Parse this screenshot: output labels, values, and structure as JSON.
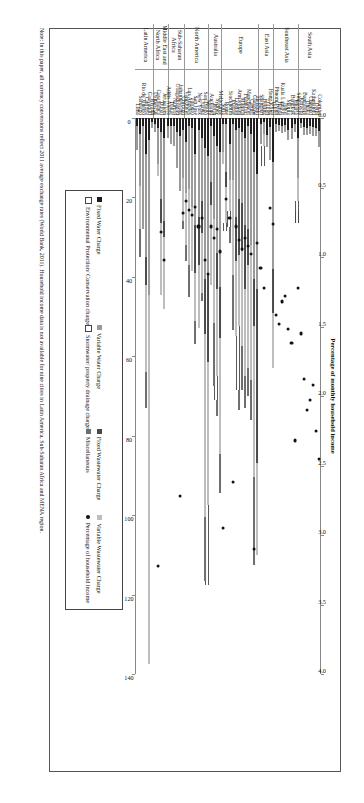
{
  "figure": {
    "note": "Note: In this paper, all currency conversions reflect 2011 average exchange rates (World Bank, 2011). Household income data is not available for nine cities in Latin America, Sub-Saharan Africa and MENA region."
  },
  "legend": {
    "columns": [
      [
        {
          "key": "fixed-water-charge",
          "label": "Fixed Water Charge",
          "swatch": "k-fixwater"
        },
        {
          "key": "epcc",
          "label": "Environmental Protection/ Conservation charge",
          "swatch": "k-epcc"
        }
      ],
      [
        {
          "key": "variable-water-charge",
          "label": "Variable Water Charge",
          "swatch": "k-varwater"
        },
        {
          "key": "stormwater-drainage",
          "label": "Stormwater/ property drainage charge",
          "swatch": "k-storm"
        }
      ],
      [
        {
          "key": "fixed-wastewater-charge",
          "label": "Fixed Wastewater Charge",
          "swatch": "k-fixwaste"
        },
        {
          "key": "miscellaneous",
          "label": "Miscellaneous",
          "swatch": "k-misc"
        }
      ],
      [
        {
          "key": "variable-wastewater-charge",
          "label": "Variable Wastewater Charge",
          "swatch": "k-varwaste"
        },
        {
          "key": "percentage-household-income",
          "label": "Percentage of household income",
          "swatch": "k-dot"
        }
      ]
    ]
  },
  "chart_data": {
    "type": "bar",
    "orientation": "horizontal-stacked",
    "title": "",
    "xlabel": "Domestic water and wastewater bill (USD per month)",
    "xlabel_secondary": "Percentage of monthly household income",
    "ylabel": "",
    "xlim": [
      0,
      140
    ],
    "xticks": [
      0,
      20,
      40,
      60,
      80,
      100,
      120,
      140
    ],
    "xlim_secondary": [
      0.0,
      4.0
    ],
    "xticks_secondary": [
      "0.0",
      "0.5",
      "1.0",
      "1.5",
      "2.0",
      "2.5",
      "3.0",
      "3.5",
      "4.0"
    ],
    "grid": false,
    "legend_position": "bottom",
    "stack_order": [
      "Fixed Water Charge",
      "Variable Water Charge",
      "Fixed Wastewater Charge",
      "Variable Wastewater Charge",
      "Stormwater/ property drainage charge",
      "Environmental Protection/ Conservation charge",
      "Miscellaneous"
    ],
    "regions": [
      {
        "name": "South Asia",
        "lines": [
          "South Asia"
        ],
        "count": 7
      },
      {
        "name": "Southeast Asia",
        "lines": [
          "Southeast Asia"
        ],
        "count": 8
      },
      {
        "name": "East Asia",
        "lines": [
          "East Asia"
        ],
        "count": 5
      },
      {
        "name": "Europe",
        "lines": [
          "Europe"
        ],
        "count": 12
      },
      {
        "name": "Australia",
        "lines": [
          "Australia"
        ],
        "count": 4
      },
      {
        "name": "North America",
        "lines": [
          "North America"
        ],
        "count": 8
      },
      {
        "name": "Sub-Saharan Africa",
        "lines": [
          "Sub-Saharan",
          "Africa"
        ],
        "count": 5
      },
      {
        "name": "Middle East and North Africa",
        "lines": [
          "Middle East and",
          "North Africa"
        ],
        "count": 5
      },
      {
        "name": "Latin America",
        "lines": [
          "Latin America"
        ],
        "count": 5
      }
    ],
    "categories": [
      "Colombo",
      "Delhi",
      "Kathmandu",
      "Chennai",
      "Dhaka",
      "Bangalore",
      "Karachi",
      "Singapore",
      "Jakarta",
      "Bangkok",
      "Manila",
      "Johor",
      "Kuala Lumpur",
      "Hanoi",
      "Phnom Penh",
      "Tokyo",
      "Hong Kong",
      "Taipei",
      "Beijing",
      "Shanghai",
      "Helsinki",
      "Glasgow",
      "Cardiff",
      "Manchester",
      "Frankfurt",
      "Munich",
      "Amsterdam",
      "London",
      "Prague",
      "Stockholm",
      "Rome",
      "Sofia",
      "Melbourne",
      "Sydney",
      "Perth",
      "Auckland",
      "Seattle",
      "San Diego",
      "Ottawa",
      "New York",
      "San Jose",
      "Toronto",
      "Los Angeles",
      "Vancouver",
      "Chicago",
      "Johannesburg",
      "Ouagadougou",
      "Nairobi",
      "Dakar",
      "Addis Ababa",
      "Jerusalem",
      "Dubai",
      "Casablanca",
      "Damascus",
      "Riyadh",
      "Guayaquil",
      "Curitiba",
      "Rio de Janeiro",
      "Santiago",
      "Lima"
    ],
    "series": [
      {
        "name": "Fixed Water Charge",
        "class": "s-fixwater",
        "values": [
          3.2,
          2.6,
          2.2,
          2.1,
          2.4,
          2.3,
          1.2,
          5.0,
          1.6,
          2.4,
          3.1,
          1.7,
          1.9,
          1.8,
          1.6,
          11.0,
          2.2,
          4.4,
          1.0,
          1.5,
          14.0,
          8.5,
          4.0,
          2.0,
          5.0,
          3.5,
          2.5,
          3.0,
          1.5,
          6.5,
          1.5,
          1.5,
          8.5,
          7.0,
          4.5,
          2.0,
          9.5,
          7.5,
          5.0,
          3.0,
          9.0,
          2.5,
          2.0,
          6.0,
          3.0,
          4.5,
          3.5,
          2.0,
          2.0,
          2.0,
          5.0,
          3.5,
          2.5,
          1.5,
          1.0,
          5.5,
          9.0,
          2.0,
          4.0,
          2.0
        ]
      },
      {
        "name": "Variable Water Charge",
        "class": "s-varwater",
        "values": [
          4.0,
          2.0,
          2.4,
          2.0,
          1.8,
          2.0,
          1.2,
          10.0,
          2.0,
          3.0,
          2.5,
          1.8,
          2.0,
          1.6,
          2.0,
          27.0,
          8.5,
          3.0,
          3.0,
          5.0,
          29.0,
          32.0,
          28.0,
          26.0,
          22.0,
          18.0,
          18.0,
          22.0,
          14.0,
          9.0,
          12.0,
          7.0,
          34.0,
          27.0,
          21.0,
          14.0,
          30.0,
          33.0,
          16.0,
          22.0,
          18.0,
          20.0,
          16.0,
          13.0,
          12.0,
          14.0,
          9.0,
          5.0,
          4.5,
          3.0,
          21.0,
          17.0,
          9.0,
          2.0,
          1.5,
          39.0,
          26.0,
          26.0,
          13.0,
          6.0
        ]
      },
      {
        "name": "Fixed Wastewater Charge",
        "class": "s-fixwaste",
        "values": [
          0,
          0,
          0,
          0,
          0,
          0,
          0,
          0,
          0,
          0,
          0,
          0,
          0,
          0,
          0,
          11.0,
          0,
          0,
          0,
          0,
          44.0,
          12.0,
          0,
          9.0,
          16.0,
          12.0,
          14.0,
          11.0,
          0,
          0,
          4.0,
          0,
          13.0,
          9.0,
          0,
          6.0,
          22.0,
          14.0,
          8.0,
          12.0,
          12.0,
          0,
          0,
          0,
          0,
          0,
          0,
          0,
          0,
          0,
          4.0,
          6.0,
          0,
          0,
          0,
          0,
          7.0,
          0,
          0,
          0
        ]
      },
      {
        "name": "Variable Wastewater Charge",
        "class": "s-varwaste",
        "values": [
          0,
          0,
          0,
          0,
          0,
          0,
          0,
          6.0,
          0,
          0,
          0,
          0,
          0,
          0,
          0,
          14.0,
          0,
          0,
          3.0,
          0,
          23.0,
          38.0,
          34.0,
          26.0,
          22.0,
          24.0,
          18.0,
          19.0,
          24.0,
          8.0,
          9.0,
          3.0,
          29.0,
          22.0,
          26.0,
          20.0,
          36.0,
          46.0,
          15.0,
          16.0,
          12.0,
          16.0,
          19.0,
          13.0,
          11.0,
          0,
          0,
          0,
          0,
          0,
          18.0,
          18.0,
          3.0,
          0,
          0,
          93.0,
          22.0,
          0,
          11.0,
          0
        ]
      },
      {
        "name": "Stormwater/ property drainage charge",
        "class": "s-storm",
        "values": [
          0,
          0,
          0,
          0,
          0,
          0,
          0,
          2.5,
          0,
          0,
          0,
          0,
          0,
          0,
          0,
          0,
          0,
          0,
          5.0,
          0,
          0,
          0,
          0,
          0,
          0,
          0,
          16.0,
          0,
          0,
          4.0,
          2.0,
          0,
          0,
          6.0,
          0,
          0,
          20.0,
          0,
          0,
          0,
          0,
          0,
          0,
          0,
          0,
          0,
          0,
          0,
          0,
          0,
          0,
          0,
          0,
          0,
          0,
          0,
          0,
          0,
          0,
          0
        ]
      },
      {
        "name": "Environmental Protection/ Conservation charge",
        "class": "s-epcc",
        "values": [
          0,
          0,
          0,
          0,
          0,
          0,
          0,
          3.0,
          0,
          0,
          0,
          0,
          0,
          0,
          0,
          0,
          0,
          0,
          0,
          0,
          0,
          0,
          0,
          0,
          0,
          0,
          0,
          0,
          0,
          0,
          0,
          0,
          0,
          0,
          0,
          0,
          0,
          0,
          0,
          0,
          0,
          0,
          0,
          0,
          0,
          0,
          0,
          0,
          0,
          0,
          0,
          0,
          0,
          0,
          0,
          0,
          0,
          0,
          0,
          0
        ]
      },
      {
        "name": "Miscellaneous",
        "class": "s-misc",
        "values": [
          0,
          0,
          0,
          0,
          0,
          0,
          0,
          0,
          0,
          0,
          0,
          0,
          0,
          0,
          0,
          0,
          0,
          0,
          0,
          0,
          0,
          22.0,
          10.0,
          7.0,
          8.0,
          11.0,
          5.0,
          0,
          14.0,
          4.0,
          0,
          0,
          10.0,
          4.0,
          16.0,
          0,
          0,
          16.0,
          2.0,
          0,
          6.0,
          0,
          8.0,
          4.0,
          2.0,
          0,
          0,
          0,
          0,
          0,
          0,
          0,
          0,
          0,
          0,
          0,
          9.0,
          0,
          7.0,
          0
        ]
      }
    ],
    "income_percentage": {
      "name": "Percentage of household income",
      "values": [
        2.45,
        2.25,
        1.92,
        2.03,
        2.1,
        1.88,
        1.55,
        1.22,
        2.32,
        1.62,
        1.52,
        1.28,
        1.32,
        1.48,
        1.42,
        0.76,
        0.65,
        null,
        1.22,
        1.08,
        0.9,
        3.1,
        0.98,
        0.92,
        0.86,
        0.94,
        0.88,
        0.78,
        2.62,
        0.72,
        0.58,
        2.95,
        0.96,
        0.8,
        0.86,
        0.78,
        1.12,
        1.02,
        0.72,
        0.78,
        0.64,
        0.7,
        0.66,
        0.6,
        0.68,
        2.72,
        null,
        null,
        null,
        null,
        1.02,
        0.82,
        3.22,
        null,
        null,
        null,
        null,
        null,
        null,
        null
      ]
    }
  }
}
